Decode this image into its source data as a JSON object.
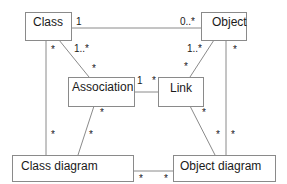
{
  "diagram": {
    "nodes": {
      "class": {
        "label": "Class"
      },
      "object": {
        "label": "Object"
      },
      "association": {
        "label": "Association"
      },
      "link": {
        "label": "Link"
      },
      "class_diagram": {
        "label": "Class diagram"
      },
      "object_diagram": {
        "label": "Object diagram"
      }
    },
    "edges": {
      "class_object": {
        "from": "Class",
        "to": "Object",
        "from_mult": "1",
        "to_mult": "0..*"
      },
      "class_association": {
        "from": "Class",
        "to": "Association",
        "from_mult": "1..*",
        "to_mult": "*"
      },
      "object_link": {
        "from": "Object",
        "to": "Link",
        "from_mult": "1..*",
        "to_mult": "*"
      },
      "association_link": {
        "from": "Association",
        "to": "Link",
        "from_mult": "1",
        "to_mult": "*"
      },
      "class_classdiagram": {
        "from": "Class",
        "to": "Class diagram",
        "from_mult": "*",
        "to_mult": "*"
      },
      "association_classdiagram": {
        "from": "Association",
        "to": "Class diagram",
        "from_mult": "*",
        "to_mult": "*"
      },
      "object_objectdiagram": {
        "from": "Object",
        "to": "Object diagram",
        "from_mult": "*",
        "to_mult": "*"
      },
      "link_objectdiagram": {
        "from": "Link",
        "to": "Object diagram",
        "from_mult": "*",
        "to_mult": "*"
      },
      "classdiagram_objectdiagram": {
        "from": "Class diagram",
        "to": "Object diagram",
        "from_mult": "*",
        "to_mult": "*"
      }
    }
  }
}
